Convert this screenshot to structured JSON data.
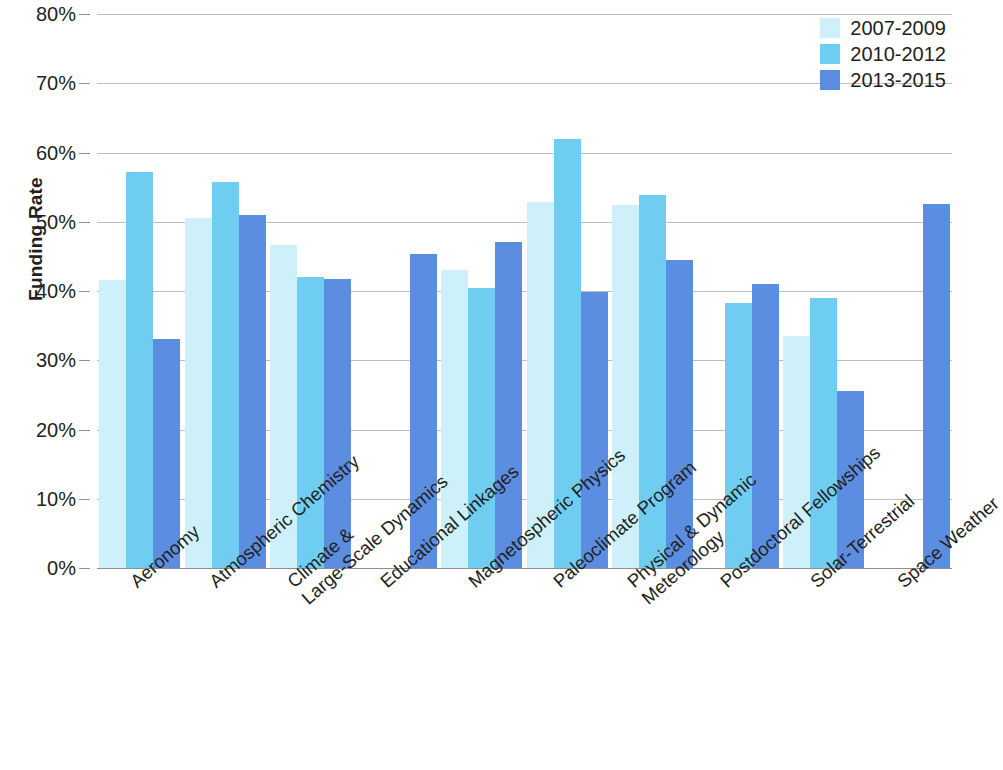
{
  "chart_data": {
    "type": "bar",
    "title": "",
    "subtitle": "",
    "xlabel": "",
    "ylabel": "Funding Rate",
    "ylim": [
      0,
      80
    ],
    "ytick_labels": [
      "0%",
      "10%",
      "20%",
      "30%",
      "40%",
      "50%",
      "60%",
      "70%",
      "80%"
    ],
    "ytick_values": [
      0,
      10,
      20,
      30,
      40,
      50,
      60,
      70,
      80
    ],
    "grid": true,
    "legend_position": "top-right",
    "value_unit": "percent",
    "categories": [
      "Aeronomy",
      "Atmospheric Chemistry",
      "Climate &\nLarge-Scale Dynamics",
      "Educational Linkages",
      "Magnetospheric Physics",
      "Paleoclimate Program",
      "Physical & Dynamic\nMeteorology",
      "Postdoctoral Fellowships",
      "Solar-Terrestrial",
      "Space Weather"
    ],
    "series": [
      {
        "name": "2007-2009",
        "color": "#cdf0fb",
        "values": [
          41.6,
          50.5,
          46.6,
          null,
          43.1,
          52.9,
          52.4,
          null,
          33.5,
          null
        ]
      },
      {
        "name": "2010-2012",
        "color": "#6fcdf2",
        "values": [
          57.2,
          55.7,
          42.0,
          null,
          40.5,
          61.9,
          53.9,
          38.2,
          39.0,
          null
        ]
      },
      {
        "name": "2013-2015",
        "color": "#5b8ee0",
        "values": [
          33.0,
          51.0,
          41.8,
          45.4,
          47.1,
          39.9,
          44.5,
          41.0,
          25.6,
          52.6
        ]
      }
    ]
  },
  "legend": {
    "entries": [
      {
        "label": "2007-2009",
        "color": "#cdf0fb"
      },
      {
        "label": "2010-2012",
        "color": "#6fcdf2"
      },
      {
        "label": "2013-2015",
        "color": "#5b8ee0"
      }
    ]
  }
}
